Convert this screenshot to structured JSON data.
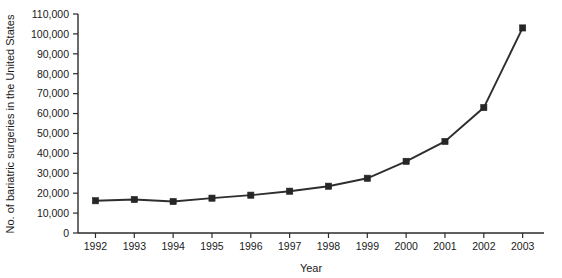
{
  "chart_data": {
    "type": "line",
    "title": "",
    "xlabel": "Year",
    "ylabel": "No. of bariatric surgeries in the United States",
    "categories": [
      "1992",
      "1993",
      "1994",
      "1995",
      "1996",
      "1997",
      "1998",
      "1999",
      "2000",
      "2001",
      "2002",
      "2003"
    ],
    "values": [
      16200,
      16800,
      15800,
      17500,
      19000,
      21000,
      23500,
      27500,
      36000,
      46000,
      63000,
      103000
    ],
    "xlim": [
      1992,
      2003
    ],
    "ylim": [
      0,
      110000
    ],
    "y_ticks": [
      0,
      10000,
      20000,
      30000,
      40000,
      50000,
      60000,
      70000,
      80000,
      90000,
      100000,
      110000
    ],
    "y_tick_labels": [
      "0",
      "10,000",
      "20,000",
      "30,000",
      "40,000",
      "50,000",
      "60,000",
      "70,000",
      "80,000",
      "90,000",
      "100,000",
      "110,000"
    ],
    "x_tick_labels": [
      "1992",
      "1993",
      "1994",
      "1995",
      "1996",
      "1997",
      "1998",
      "1999",
      "2000",
      "2001",
      "2002",
      "2003"
    ],
    "grid": false,
    "legend": false,
    "marker": "square",
    "series_color": "#2e2e2e",
    "axis_color": "#2b2b2b",
    "background_color": "#ffffff"
  }
}
